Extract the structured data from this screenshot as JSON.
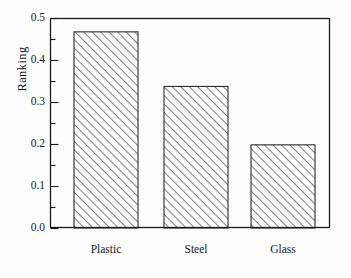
{
  "chart_data": {
    "type": "bar",
    "title": "",
    "subtitle": "",
    "xlabel": "",
    "ylabel": "Ranking",
    "categories": [
      "Plastic",
      "Steel",
      "Glass"
    ],
    "values": [
      0.467,
      0.337,
      0.198
    ],
    "series": [
      {
        "name": "Ranking",
        "values": [
          0.467,
          0.337,
          0.198
        ]
      }
    ],
    "ylim": [
      0.0,
      0.5
    ],
    "xlim": [
      0,
      3
    ],
    "y_major_ticks": [
      0.0,
      0.1,
      0.2,
      0.3,
      0.4,
      0.5
    ],
    "y_tick_labels": [
      "0.0",
      "0.1",
      "0.2",
      "0.3",
      "0.4",
      "0.5"
    ],
    "y_minor_ticks": [
      0.05,
      0.15,
      0.25,
      0.35,
      0.45
    ],
    "grid": false,
    "legend": null,
    "legend_position": "none",
    "annotations": [],
    "bar_fill": "#ffffff",
    "bar_hatch": "/",
    "bar_hatch_color": "#4a4a4a",
    "bar_edge_color": "#2b2b2b",
    "axis_color": "#1a1a1a",
    "background_color": "#fdfdfd",
    "frame": "full-box",
    "tick_direction": "in"
  },
  "geometry": {
    "plot_left": 50,
    "plot_right": 330,
    "plot_top": 18,
    "plot_bottom": 228,
    "bar_width": 64,
    "bar_centers": [
      106,
      196,
      283
    ]
  }
}
